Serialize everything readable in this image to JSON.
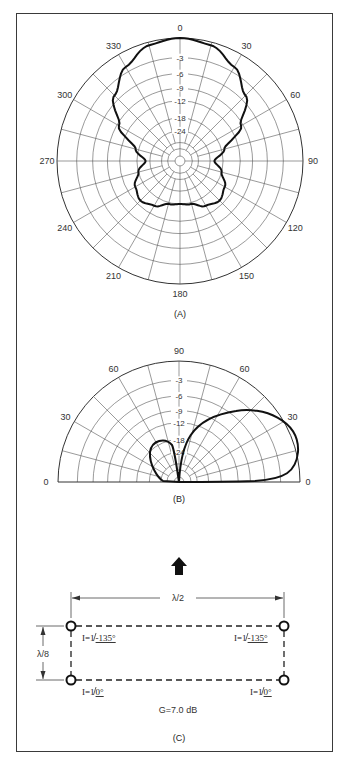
{
  "figure": {
    "panels": [
      {
        "id": "A",
        "caption": "(A)",
        "type": "polar-full",
        "angle_labels": [
          "0",
          "30",
          "60",
          "90",
          "120",
          "150",
          "180",
          "210",
          "240",
          "270",
          "300",
          "330"
        ],
        "db_labels": [
          "-3",
          "-6",
          "-9",
          "-12",
          "-18",
          "-24"
        ]
      },
      {
        "id": "B",
        "caption": "(B)",
        "type": "polar-half-elevation",
        "angle_labels": [
          "0",
          "30",
          "60",
          "90",
          "60",
          "30",
          "0"
        ],
        "db_labels": [
          "-3",
          "-6",
          "-9",
          "-12",
          "-18",
          "-24"
        ]
      },
      {
        "id": "C",
        "caption": "(C)",
        "type": "array-layout",
        "direction_arrow": "up-arrow",
        "horizontal_spacing": "λ/2",
        "vertical_spacing": "λ/8",
        "elements": [
          {
            "position": "top-left",
            "label": "I=1",
            "phase": "-135°"
          },
          {
            "position": "top-right",
            "label": "I=1",
            "phase": "-135°"
          },
          {
            "position": "bottom-left",
            "label": "I=1",
            "phase": "0°"
          },
          {
            "position": "bottom-right",
            "label": "I=1",
            "phase": "0°"
          }
        ],
        "gain": "G=7.0 dB"
      }
    ]
  },
  "chart_data": [
    {
      "type": "polar",
      "title": "(A) Azimuth pattern",
      "angle_ticks_deg": [
        0,
        30,
        60,
        90,
        120,
        150,
        180,
        210,
        240,
        270,
        300,
        330
      ],
      "radial_ticks_db": [
        0,
        -3,
        -6,
        -9,
        -12,
        -18,
        -24
      ],
      "pattern_db": {
        "angles": [
          0,
          15,
          30,
          45,
          60,
          75,
          90,
          105,
          120,
          135,
          150,
          165,
          180
        ],
        "values": [
          0,
          -0.5,
          -2.2,
          -5,
          -9.5,
          -17,
          -22,
          -18,
          -15,
          -13.5,
          -15,
          -17.5,
          -18
        ]
      },
      "symmetry": "mirror about 0-180 axis"
    },
    {
      "type": "polar",
      "title": "(B) Elevation pattern",
      "angle_ticks_deg": [
        0,
        30,
        60,
        90,
        60,
        30,
        0
      ],
      "radial_ticks_db": [
        0,
        -3,
        -6,
        -9,
        -12,
        -18,
        -24
      ],
      "front_lobe": {
        "peak_elevation_deg": 25,
        "peak_db": 0
      },
      "back_lobe": {
        "peak_elevation_deg": 115,
        "peak_db": -15
      }
    }
  ],
  "colors": {
    "line": "#111111",
    "grid": "#555555",
    "frame": "#3a3a3a"
  }
}
